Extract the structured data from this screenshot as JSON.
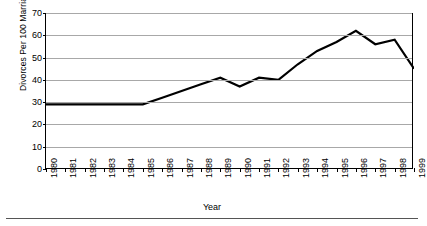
{
  "chart_data": {
    "type": "line",
    "title": "",
    "xlabel": "Year",
    "ylabel": "Divorces Per 100 Marriages",
    "categories": [
      "1980",
      "1981",
      "1982",
      "1983",
      "1984",
      "1985",
      "1986",
      "1987",
      "1988",
      "1989",
      "1990",
      "1991",
      "1992",
      "1993",
      "1994",
      "1995",
      "1996",
      "1997",
      "1998",
      "1999"
    ],
    "values": [
      29,
      29,
      29,
      29,
      29,
      29,
      32,
      35,
      38,
      41,
      37,
      41,
      40,
      47,
      53,
      57,
      62,
      56,
      58,
      45
    ],
    "series": [
      {
        "name": "Divorces Per 100 Marriages",
        "values": [
          29,
          29,
          29,
          29,
          29,
          29,
          32,
          35,
          38,
          41,
          37,
          41,
          40,
          47,
          53,
          57,
          62,
          56,
          58,
          45
        ],
        "color": "#000000"
      }
    ],
    "ylim": [
      0,
      70
    ],
    "yticks": [
      0,
      10,
      20,
      30,
      40,
      50,
      60,
      70
    ],
    "ytick_labels": [
      "0",
      "10",
      "20",
      "30",
      "40",
      "50",
      "60",
      "70"
    ],
    "grid": true,
    "grid_axis": "y",
    "grid_color": "#a8a8a8",
    "legend": false,
    "legend_position": "none",
    "line_color": "#000000",
    "line_width": 2.2,
    "markers": false,
    "background": "#ffffff"
  }
}
